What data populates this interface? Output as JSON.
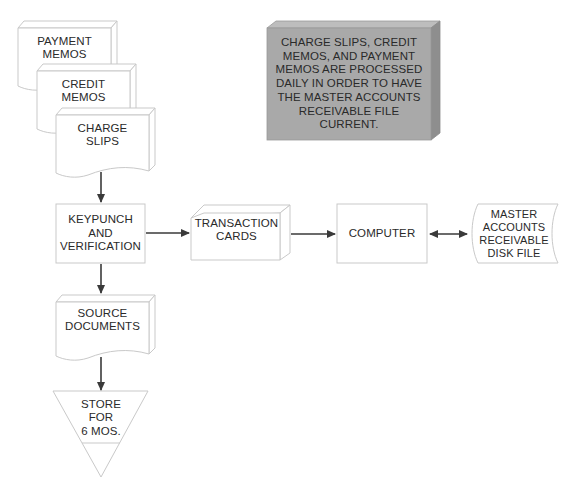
{
  "diagram": {
    "type": "system-flowchart",
    "colors": {
      "stroke": "#c9c9c9",
      "line": "#3a3a3a",
      "note_fill": "#a9a9a9",
      "note_side": "#8e8e8e",
      "note_top": "#bdbdbd",
      "text": "#2a2a2a"
    },
    "nodes": {
      "payment_memos": {
        "label": "PAYMENT\nMEMOS",
        "shape": "document"
      },
      "credit_memos": {
        "label": "CREDIT\nMEMOS",
        "shape": "document"
      },
      "charge_slips": {
        "label": "CHARGE\nSLIPS",
        "shape": "document"
      },
      "keypunch": {
        "label": "KEYPUNCH\nAND\nVERIFICATION",
        "shape": "process"
      },
      "transaction_cards": {
        "label": "TRANSACTION\nCARDS",
        "shape": "card-deck"
      },
      "computer": {
        "label": "COMPUTER",
        "shape": "process"
      },
      "disk_file": {
        "label": "MASTER\nACCOUNTS\nRECEIVABLE\nDISK FILE",
        "shape": "disk-storage"
      },
      "source_documents": {
        "label": "SOURCE\nDOCUMENTS",
        "shape": "document"
      },
      "store": {
        "label": "STORE\nFOR\n6 MOS.",
        "shape": "offline-storage"
      }
    },
    "note": {
      "text": "CHARGE SLIPS, CREDIT\nMEMOS, AND PAYMENT\nMEMOS ARE PROCESSED\nDAILY IN ORDER TO HAVE\nTHE MASTER ACCOUNTS\nRECEIVABLE FILE\nCURRENT."
    },
    "edges": [
      {
        "from": "charge_slips",
        "to": "keypunch",
        "direction": "one-way"
      },
      {
        "from": "keypunch",
        "to": "transaction_cards",
        "direction": "one-way"
      },
      {
        "from": "transaction_cards",
        "to": "computer",
        "direction": "one-way"
      },
      {
        "from": "computer",
        "to": "disk_file",
        "direction": "two-way"
      },
      {
        "from": "keypunch",
        "to": "source_documents",
        "direction": "one-way"
      },
      {
        "from": "source_documents",
        "to": "store",
        "direction": "one-way"
      }
    ]
  }
}
